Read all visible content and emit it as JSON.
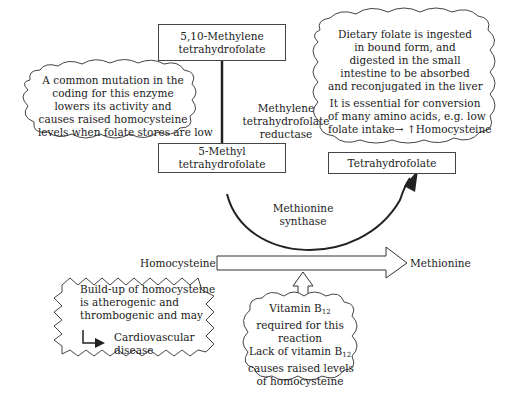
{
  "nodes": {
    "methylene_thf": {
      "lines": [
        "5,10-Methylene",
        "tetrahydrofolate"
      ]
    },
    "methyl_thf": {
      "lines": [
        "5-Methyl",
        "tetrahydrofolate"
      ]
    },
    "thf": {
      "lines": [
        "Tetrahydrofolate"
      ]
    },
    "homocysteine": "Homocysteine",
    "methionine": "Methionine"
  },
  "enzymes": {
    "mthfr": {
      "lines": [
        "Methylene",
        "tetrahydrofolate",
        "reductase"
      ]
    },
    "methionine_synthase": {
      "lines": [
        "Methionine",
        "synthase"
      ]
    }
  },
  "callouts": {
    "mutation": {
      "lines": [
        "A common mutation in the",
        "coding for this enzyme",
        "lowers its activity and",
        "causes raised homocysteine",
        "levels when folate stores are low"
      ]
    },
    "dietary_folate": {
      "para1": [
        "Dietary folate is ingested",
        "in bound form, and",
        "digested in the small",
        "intestine to be absorbed",
        "and reconjugated in the liver"
      ],
      "para2": [
        "It is essential for conversion",
        "of many amino acids, e.g. low",
        "folate intake→ ↑Homocysteine"
      ]
    },
    "buildup": {
      "lines": [
        "Build-up of homocysteine",
        "is atherogenic and",
        "thrombogenic and may"
      ],
      "outcome": [
        "Cardiovascular",
        "disease"
      ]
    },
    "b12": {
      "line1_prefix": "Vitamin B",
      "line1_sub": "12",
      "lines_mid": [
        "required for this",
        "reaction"
      ],
      "line4_prefix": "Lack of vitamin B",
      "line4_sub": "12",
      "lines_end": [
        "causes raised levels",
        "of homocysteine"
      ]
    }
  },
  "colors": {
    "stroke": "#333333",
    "text": "#222222",
    "background": "#ffffff"
  }
}
